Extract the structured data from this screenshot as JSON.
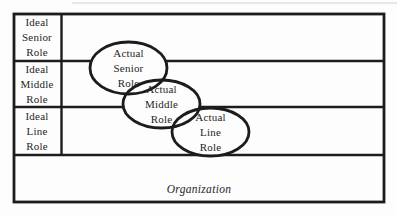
{
  "labels": {
    "ideal_senior": [
      "Ideal",
      "Senior",
      "Role"
    ],
    "ideal_middle": [
      "Ideal",
      "Middle",
      "Role"
    ],
    "ideal_line": [
      "Ideal",
      "Line",
      "Role"
    ],
    "actual_senior": [
      "Actual",
      "Senior",
      "Role"
    ],
    "actual_middle": [
      "Actual",
      "Middle",
      "Role"
    ],
    "actual_line": [
      "Actual",
      "Line",
      "Role"
    ],
    "organization": "Organization"
  },
  "colors": {
    "line": "#1c1c1c",
    "text": "#262626",
    "background": "#fdfdfd",
    "ellipse_fill": "#fdfdfd"
  }
}
